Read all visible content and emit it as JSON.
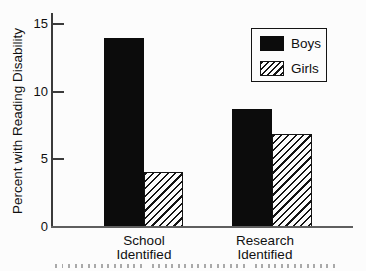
{
  "chart_data": {
    "type": "bar",
    "title": "",
    "ylabel": "Percent with Reading Disability",
    "xlabel": "",
    "categories": [
      "School Identified",
      "Research Identified"
    ],
    "series": [
      {
        "name": "Boys",
        "style": "solid",
        "values": [
          14.0,
          8.7
        ]
      },
      {
        "name": "Girls",
        "style": "diagonal-hatch",
        "values": [
          4.1,
          6.9
        ]
      }
    ],
    "ylim": [
      0,
      15.8
    ],
    "yticks": [
      0,
      5,
      10,
      15
    ],
    "grid": false,
    "legend": {
      "position": "top-right",
      "entries": [
        "Boys",
        "Girls"
      ]
    },
    "colors": {
      "bar_fill": "#0c0c0c",
      "hatch_line": "#141414",
      "axis": "#3b3b3b",
      "text": "#101010",
      "background": "#fcfcfc"
    }
  }
}
